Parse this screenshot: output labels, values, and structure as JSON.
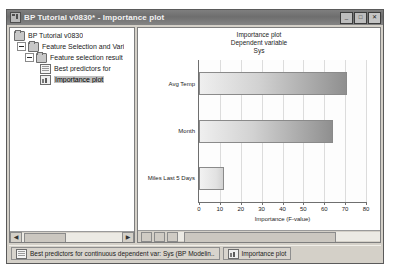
{
  "window": {
    "title": "BP Tutorial v0830* - Importance plot",
    "app_icon": "workbook-icon",
    "controls": [
      {
        "name": "minimize-button",
        "glyph": "_"
      },
      {
        "name": "maximize-button",
        "glyph": "□"
      },
      {
        "name": "close-button",
        "glyph": "✕"
      }
    ]
  },
  "tree": {
    "items": [
      {
        "label": "BP Tutorial v0830",
        "depth": 0,
        "icon": "folder-icon",
        "expander": "none",
        "selected": false
      },
      {
        "label": "Feature Selection and Vari",
        "depth": 1,
        "icon": "folder-icon",
        "expander": "minus",
        "selected": false
      },
      {
        "label": "Feature selection result",
        "depth": 2,
        "icon": "folder-icon",
        "expander": "minus",
        "selected": false
      },
      {
        "label": "Best predictors for",
        "depth": 3,
        "icon": "sheet-icon",
        "expander": "none",
        "selected": false
      },
      {
        "label": "Importance plot",
        "depth": 3,
        "icon": "graph-icon",
        "expander": "none",
        "selected": true
      }
    ],
    "scroll": {
      "left_arrow": "◀",
      "right_arrow": "▶"
    }
  },
  "chart_data": {
    "type": "bar",
    "orientation": "horizontal",
    "title": "Importance plot",
    "subtitle": "Dependent variable",
    "subtitle2": "Sys",
    "categories": [
      "Avg Temp",
      "Month",
      "Miles Last 5 Days"
    ],
    "values": [
      71.0,
      64.0,
      12.0
    ],
    "xlabel": "Importance (F-value)",
    "ylabel": "",
    "xlim": [
      0,
      80
    ],
    "xticks": [
      0,
      10,
      20,
      30,
      40,
      50,
      60,
      70,
      80
    ],
    "grid": true,
    "legend": false,
    "bar_fill": "#d2d2d2",
    "bar_edge": "#8a8a8a"
  },
  "taskbar": {
    "buttons": [
      {
        "name": "taskbar-item-best-predictors",
        "label": "Best predictors for continuous dependent var: Sys (BP Modelin..",
        "icon": "sheet-icon"
      },
      {
        "name": "taskbar-item-importance-plot",
        "label": "Importance plot",
        "icon": "graph-icon"
      }
    ]
  }
}
